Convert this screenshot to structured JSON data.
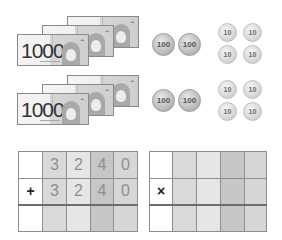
{
  "money": {
    "groups": [
      {
        "bills": [
          {
            "value": "1000",
            "mark": "ᄉ"
          },
          {
            "value": "1000",
            "mark": "ᄉ"
          },
          {
            "value": "1000",
            "mark": "ᄉ"
          }
        ],
        "coins_100": [
          "100",
          "100"
        ],
        "coins_10": [
          "10",
          "10",
          "10",
          "10"
        ]
      },
      {
        "bills": [
          {
            "value": "1000",
            "mark": "ᄉ"
          },
          {
            "value": "1000",
            "mark": "ᄉ"
          },
          {
            "value": "1000",
            "mark": "ᄉ"
          }
        ],
        "coins_100": [
          "100",
          "100"
        ],
        "coins_10": [
          "10",
          "10",
          "10",
          "10"
        ]
      }
    ]
  },
  "addition_grid": {
    "operator": "+",
    "row1": [
      "3",
      "2",
      "4",
      "0"
    ],
    "row2": [
      "3",
      "2",
      "4",
      "0"
    ],
    "result": [
      "",
      "",
      "",
      ""
    ]
  },
  "multiplication_grid": {
    "operator": "×",
    "row1": [
      "",
      "",
      "",
      ""
    ],
    "row2": [
      "",
      "",
      "",
      ""
    ],
    "result": [
      "",
      "",
      "",
      ""
    ]
  }
}
